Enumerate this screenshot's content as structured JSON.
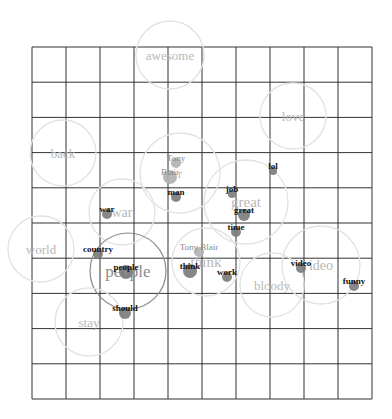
{
  "diagram": {
    "type": "word-cluster-map",
    "grid": {
      "x0": 32,
      "y0": 47,
      "x1": 372,
      "y1": 399,
      "cols": 10,
      "rows": 10,
      "color": "#333333"
    },
    "colors": {
      "cluster_label": "#b8b8b8",
      "cluster_circle_light": "#e2e2e2",
      "cluster_circle_dark": "#8a8a8a",
      "dot": "#7a7a7a",
      "dot_light": "#b0b0b0",
      "word_label": "#111111",
      "entity_label": "#8a8a8a"
    },
    "clusters": [
      {
        "label": "awesome",
        "cx": 170,
        "cy": 55,
        "r": 34,
        "strong": false,
        "fontSize": 13
      },
      {
        "label": "love",
        "cx": 293,
        "cy": 116,
        "r": 33,
        "strong": false,
        "fontSize": 13
      },
      {
        "label": "back",
        "cx": 63,
        "cy": 153,
        "r": 33,
        "strong": false,
        "fontSize": 13
      },
      {
        "label": "r",
        "cx": 180,
        "cy": 173,
        "r": 40,
        "strong": false,
        "fontSize": 13
      },
      {
        "label": "great",
        "cx": 246,
        "cy": 202,
        "r": 42,
        "strong": false,
        "fontSize": 15
      },
      {
        "label": "war",
        "cx": 122,
        "cy": 212,
        "r": 33,
        "strong": false,
        "fontSize": 14
      },
      {
        "label": "world",
        "cx": 41,
        "cy": 249,
        "r": 33,
        "strong": false,
        "fontSize": 13
      },
      {
        "label": "people",
        "cx": 128,
        "cy": 271,
        "r": 38,
        "strong": true,
        "fontSize": 17
      },
      {
        "label": "think",
        "cx": 206,
        "cy": 262,
        "r": 34,
        "strong": false,
        "fontSize": 15
      },
      {
        "label": "ideo",
        "cx": 321,
        "cy": 265,
        "r": 39,
        "strong": false,
        "fontSize": 14
      },
      {
        "label": "bloody",
        "cx": 272,
        "cy": 285,
        "r": 32,
        "strong": false,
        "fontSize": 13
      },
      {
        "label": "stay",
        "cx": 89,
        "cy": 322,
        "r": 34,
        "strong": false,
        "fontSize": 13
      }
    ],
    "words": [
      {
        "label": "Tony",
        "x": 176,
        "y": 161,
        "dot": true,
        "dotR": 5,
        "entity": true
      },
      {
        "label": "Blair",
        "x": 170,
        "y": 175,
        "dot": true,
        "dotR": 7,
        "entity": true
      },
      {
        "label": "man",
        "x": 176,
        "y": 195,
        "dot": true,
        "dotR": 5,
        "entity": false
      },
      {
        "label": "lol",
        "x": 273,
        "y": 169,
        "dot": true,
        "dotR": 4,
        "entity": false
      },
      {
        "label": "job",
        "x": 232,
        "y": 192,
        "dot": true,
        "dotR": 4,
        "entity": false
      },
      {
        "label": "great",
        "x": 244,
        "y": 213,
        "dot": true,
        "dotR": 6,
        "entity": false
      },
      {
        "label": "time",
        "x": 236,
        "y": 230,
        "dot": true,
        "dotR": 5,
        "entity": false
      },
      {
        "label": "war",
        "x": 107,
        "y": 212,
        "dot": true,
        "dotR": 5,
        "entity": false
      },
      {
        "label": "country",
        "x": 98,
        "y": 252,
        "dot": true,
        "dotR": 5,
        "entity": false
      },
      {
        "label": "people",
        "x": 126,
        "y": 270,
        "dot": true,
        "dotR": 7,
        "entity": false
      },
      {
        "label": "Tony Blair",
        "x": 199,
        "y": 250,
        "dot": true,
        "dotR": 5,
        "entity": true
      },
      {
        "label": "think",
        "x": 190,
        "y": 269,
        "dot": true,
        "dotR": 7,
        "entity": false
      },
      {
        "label": "work",
        "x": 227,
        "y": 275,
        "dot": true,
        "dotR": 5,
        "entity": false
      },
      {
        "label": "video",
        "x": 301,
        "y": 266,
        "dot": true,
        "dotR": 5,
        "entity": false
      },
      {
        "label": "funny",
        "x": 354,
        "y": 284,
        "dot": true,
        "dotR": 5,
        "entity": false
      },
      {
        "label": "should",
        "x": 125,
        "y": 311,
        "dot": true,
        "dotR": 6,
        "entity": false
      }
    ]
  }
}
